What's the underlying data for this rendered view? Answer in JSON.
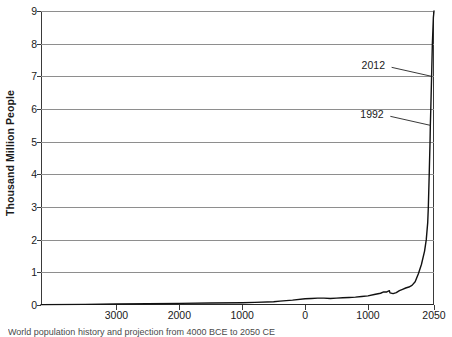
{
  "chart_data": {
    "type": "line",
    "title": "",
    "xlabel": "",
    "ylabel": "Thousand Million People",
    "xlim": [
      -4200,
      2050
    ],
    "ylim": [
      0,
      9
    ],
    "grid": true,
    "legend": "none",
    "y_ticks": [
      "0",
      "1",
      "2",
      "3",
      "4",
      "5",
      "6",
      "7",
      "8",
      "9"
    ],
    "y_tick_values": [
      0,
      1,
      2,
      3,
      4,
      5,
      6,
      7,
      8,
      9
    ],
    "x_ticks": [
      "3000",
      "2000",
      "1000",
      "0",
      "1000",
      "2050"
    ],
    "x_tick_values": [
      -3000,
      -2000,
      -1000,
      0,
      1000,
      2050
    ],
    "series": [
      {
        "name": "World population",
        "x": [
          -4200,
          -3500,
          -3000,
          -2500,
          -2000,
          -1500,
          -1000,
          -800,
          -500,
          -400,
          -200,
          0,
          100,
          200,
          300,
          400,
          500,
          600,
          700,
          800,
          900,
          1000,
          1100,
          1200,
          1250,
          1300,
          1340,
          1350,
          1400,
          1450,
          1500,
          1550,
          1600,
          1650,
          1700,
          1750,
          1800,
          1850,
          1900,
          1927,
          1950,
          1960,
          1974,
          1987,
          1992,
          1999,
          2012,
          2024,
          2040,
          2050
        ],
        "y": [
          0.01,
          0.02,
          0.03,
          0.04,
          0.05,
          0.06,
          0.07,
          0.08,
          0.1,
          0.12,
          0.15,
          0.19,
          0.2,
          0.21,
          0.21,
          0.2,
          0.21,
          0.22,
          0.23,
          0.24,
          0.26,
          0.28,
          0.32,
          0.36,
          0.4,
          0.4,
          0.44,
          0.37,
          0.35,
          0.38,
          0.44,
          0.48,
          0.52,
          0.55,
          0.6,
          0.71,
          0.95,
          1.24,
          1.65,
          2.0,
          2.52,
          3.0,
          4.0,
          5.0,
          5.5,
          6.0,
          7.0,
          8.0,
          8.8,
          9.0
        ]
      }
    ],
    "annotations": [
      {
        "label": "2012",
        "x_value": 2012,
        "y_value": 7.0
      },
      {
        "label": "1992",
        "x_value": 1992,
        "y_value": 5.5
      }
    ]
  },
  "caption": {
    "text": "World population history and projection from 4000 BCE to 2050 CE"
  }
}
